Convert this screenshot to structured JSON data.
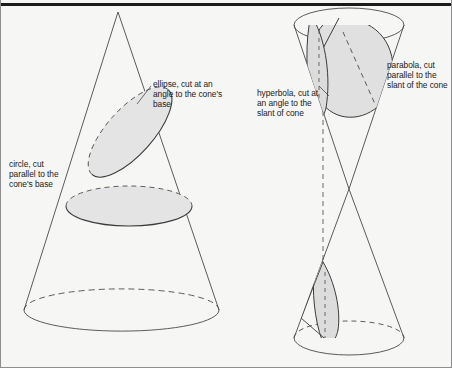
{
  "figure": {
    "background_color": "#f6f6f5",
    "line_color": "#4a4a4a",
    "fill_color": "#e4e4e4",
    "rule_color": "#1b1b1b"
  },
  "labels": {
    "ellipse": "ellipse, cut at an angle to the cone's base",
    "circle": "circle, cut parallel to the cone's base",
    "hyperbola": "hyperbola, cut at an angle to the slant of cone",
    "parabola": "parabola, cut parallel to the slant of the cone"
  },
  "diagram_data": {
    "type": "geometric-diagram",
    "subject": "conic sections",
    "figures": [
      {
        "name": "single-cone-left",
        "apex": [
          117,
          12
        ],
        "base_center": [
          120,
          310
        ],
        "base_radius_x": 97,
        "base_radius_y": 21,
        "cross_sections": [
          {
            "name": "ellipse",
            "orientation": "oblique",
            "angle_deg": 45
          },
          {
            "name": "circle",
            "orientation": "horizontal",
            "angle_deg": 0
          }
        ]
      },
      {
        "name": "double-cone-right",
        "apex": [
          348,
          189
        ],
        "top_center": [
          348,
          25
        ],
        "top_radius_x": 55,
        "top_radius_y": 17,
        "bottom_center": [
          348,
          338
        ],
        "bottom_radius_x": 55,
        "bottom_radius_y": 17,
        "axis": "vertical dashed line",
        "cross_sections": [
          {
            "name": "hyperbola",
            "orientation": "vertical",
            "angle_deg": 90
          },
          {
            "name": "parabola",
            "orientation": "slant-parallel",
            "angle_deg": 30
          }
        ]
      }
    ]
  }
}
